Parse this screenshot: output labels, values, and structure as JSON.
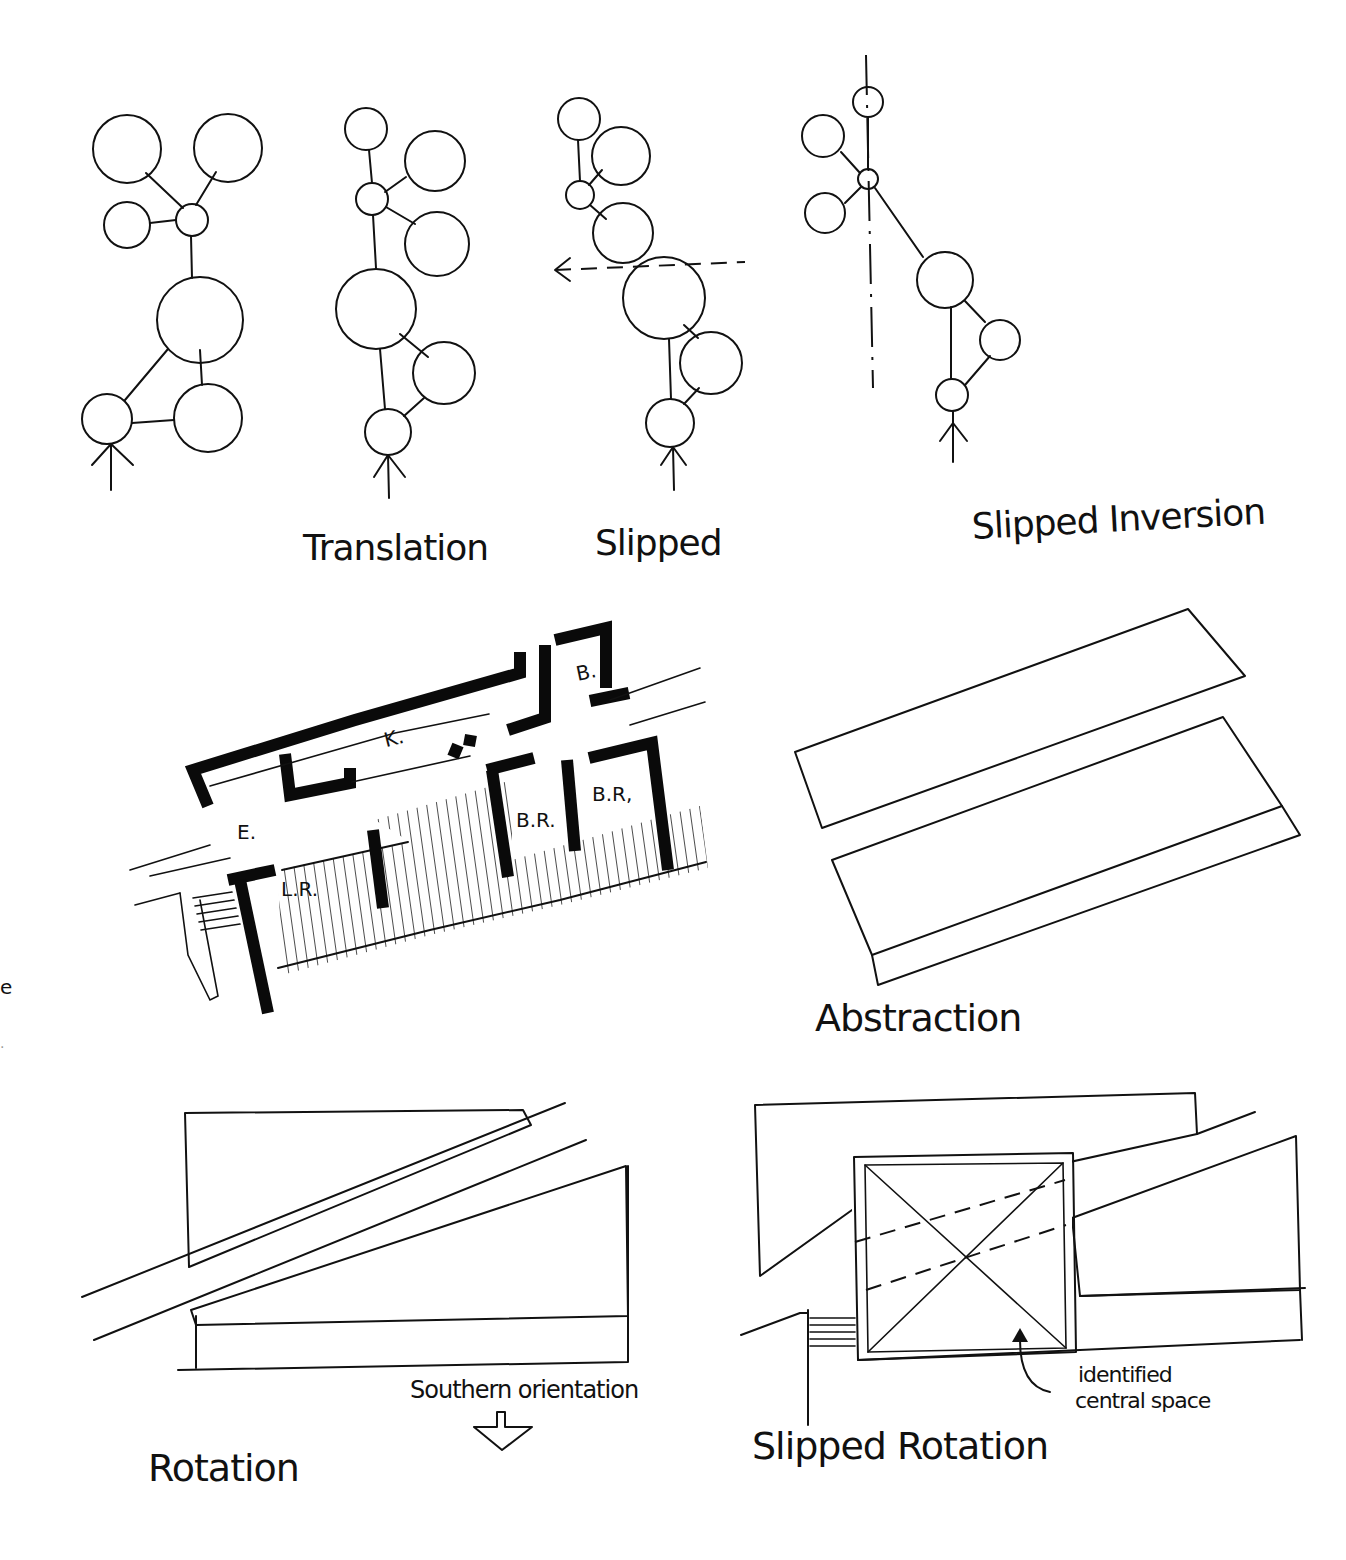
{
  "diagram": {
    "type": "architectural-concept-sketches",
    "panels": [
      {
        "id": "translation",
        "label": "Translation"
      },
      {
        "id": "slipped",
        "label": "Slipped"
      },
      {
        "id": "slipped-inversion",
        "label": "Slipped Inversion"
      },
      {
        "id": "floor-plan",
        "rooms": [
          "K.",
          "B.",
          "E.",
          "L.R.",
          "B.R.",
          "B.R."
        ]
      },
      {
        "id": "abstraction",
        "label": "Abstraction"
      },
      {
        "id": "rotation",
        "label": "Rotation",
        "annotation": "Southern orientation"
      },
      {
        "id": "slipped-rotation",
        "label": "Slipped Rotation",
        "annotation": "identified central space"
      }
    ]
  },
  "labels": {
    "translation": "Translation",
    "slipped": "Slipped",
    "slipped_inversion": "Slipped Inversion",
    "abstraction": "Abstraction",
    "rotation": "Rotation",
    "southern_orientation": "Southern orientation",
    "slipped_rotation": "Slipped Rotation",
    "identified_line1": "identified",
    "identified_line2": "central space"
  },
  "rooms": {
    "kitchen": "K.",
    "bath": "B.",
    "entry": "E.",
    "living_room": "L.R.",
    "bedroom_1": "B.R.",
    "bedroom_2": "B.R,"
  },
  "margin_fragments": {
    "glyph_1": "e",
    "glyph_2": "."
  }
}
